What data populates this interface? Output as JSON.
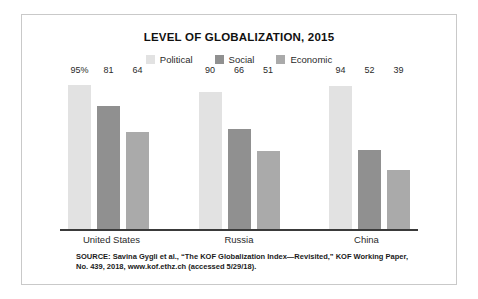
{
  "chart_data": {
    "type": "bar",
    "title": "LEVEL OF GLOBALIZATION, 2015",
    "xlabel": "",
    "ylabel": "",
    "ylim": [
      0,
      100
    ],
    "grid": false,
    "legend_position": "top-center",
    "categories": [
      "United States",
      "Russia",
      "China"
    ],
    "series": [
      {
        "name": "Political",
        "color": "#e2e2e2",
        "values": [
          95,
          90,
          94
        ],
        "value_labels": [
          "95%",
          "90",
          "94"
        ]
      },
      {
        "name": "Social",
        "color": "#909090",
        "values": [
          81,
          66,
          52
        ],
        "value_labels": [
          "81",
          "66",
          "52"
        ]
      },
      {
        "name": "Economic",
        "color": "#aaaaaa",
        "values": [
          64,
          51,
          39
        ],
        "value_labels": [
          "64",
          "51",
          "39"
        ]
      }
    ],
    "source_note": "SOURCE: Savina Gygli et al., “The KOF Globalization Index—Revisited,” KOF Working Paper, No. 439, 2018, www.kof.ethz.ch (accessed 5/29/18)."
  },
  "colors": {
    "frame_border": "#c9c9c9",
    "axis": "#3a3a3a",
    "text": "#1a1a1a",
    "background": "#ffffff"
  }
}
